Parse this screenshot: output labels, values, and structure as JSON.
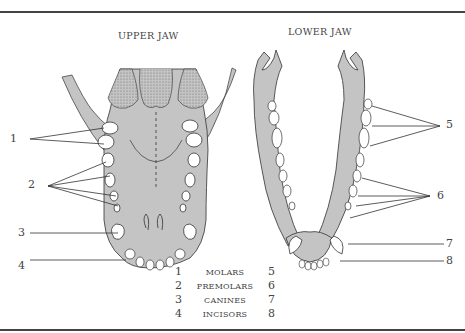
{
  "upper_jaw": {
    "title": "UPPER JAW",
    "labels": [
      {
        "num": "1",
        "target": "molars"
      },
      {
        "num": "2",
        "target": "premolars"
      },
      {
        "num": "3",
        "target": "canines"
      },
      {
        "num": "4",
        "target": "incisors"
      }
    ]
  },
  "lower_jaw": {
    "title": "LOWER JAW",
    "labels": [
      {
        "num": "5",
        "target": "molars"
      },
      {
        "num": "6",
        "target": "premolars"
      },
      {
        "num": "7",
        "target": "canines"
      },
      {
        "num": "8",
        "target": "incisors"
      }
    ]
  },
  "legend": [
    {
      "upper": "1",
      "name": "MOLARS",
      "lower": "5"
    },
    {
      "upper": "2",
      "name": "PREMOLARS",
      "lower": "6"
    },
    {
      "upper": "3",
      "name": "CANINES",
      "lower": "7"
    },
    {
      "upper": "4",
      "name": "INCISORS",
      "lower": "8"
    }
  ],
  "colors": {
    "bone_fill": "#c4c4c4",
    "stipple": "#8a8a8a",
    "outline": "#333333",
    "tooth_fill": "#ffffff"
  }
}
